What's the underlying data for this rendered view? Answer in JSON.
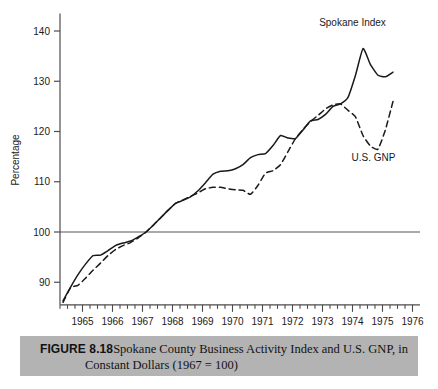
{
  "figure": {
    "label": "FIGURE 8.18",
    "caption_line_1": "Spokane County Business Activity Index and U.S. GNP, in",
    "caption_line_2": "Constant Dollars (1967 = 100)",
    "caption_bg_color": "#b3b3b3"
  },
  "chart_data": {
    "type": "line",
    "title": "",
    "subtitle": "",
    "xlabel": "",
    "ylabel": "Percentage",
    "xlim": [
      1964.25,
      1976.25
    ],
    "ylim": [
      85.5,
      143.5
    ],
    "yticks": [
      90,
      100,
      110,
      120,
      130,
      140
    ],
    "ytick_labels": [
      "90",
      "100",
      "110",
      "120",
      "130",
      "140"
    ],
    "xticks": [
      1965,
      1966,
      1967,
      1968,
      1969,
      1970,
      1971,
      1972,
      1973,
      1974,
      1975,
      1976
    ],
    "xtick_labels": [
      "1965",
      "1966",
      "1967",
      "1968",
      "1969",
      "1970",
      "1971",
      "1972",
      "1973",
      "1974",
      "1975",
      "1976"
    ],
    "minor_xtick_interval": 0.25,
    "grid": false,
    "reference_line": {
      "value": 100,
      "orientation": "horizontal",
      "color": "#8c8c8c"
    },
    "legend_position": "inline-annotations",
    "axis_color": "#4d4d4d",
    "series": [
      {
        "name": "Spokane Index",
        "style": "solid",
        "color": "#1a1a1a",
        "label_x": 1974.0,
        "label_y": 141.0,
        "x": [
          1964.35,
          1964.6,
          1964.85,
          1965.1,
          1965.35,
          1965.6,
          1965.85,
          1966.1,
          1966.35,
          1966.6,
          1966.85,
          1967.1,
          1967.35,
          1967.6,
          1967.85,
          1968.1,
          1968.35,
          1968.6,
          1968.85,
          1969.1,
          1969.35,
          1969.6,
          1969.85,
          1970.1,
          1970.35,
          1970.6,
          1970.85,
          1971.1,
          1971.35,
          1971.6,
          1971.85,
          1972.1,
          1972.35,
          1972.6,
          1972.85,
          1973.1,
          1973.35,
          1973.6,
          1973.85,
          1974.1,
          1974.35,
          1974.6,
          1974.85,
          1975.1,
          1975.35
        ],
        "y": [
          86.3,
          89.0,
          91.5,
          93.6,
          95.3,
          95.4,
          96.3,
          97.3,
          97.8,
          98.2,
          99.0,
          99.9,
          101.3,
          102.8,
          104.3,
          105.7,
          106.3,
          107.0,
          108.2,
          109.8,
          111.5,
          112.1,
          112.2,
          112.6,
          113.4,
          114.8,
          115.4,
          115.6,
          117.2,
          119.2,
          118.7,
          118.6,
          120.3,
          122.1,
          122.4,
          123.4,
          125.0,
          125.5,
          126.8,
          131.2,
          136.5,
          133.3,
          131.2,
          130.9,
          131.8
        ]
      },
      {
        "name": "U.S. GNP",
        "style": "dashed",
        "color": "#1a1a1a",
        "label_x": 1974.7,
        "label_y": 114.2,
        "x": [
          1964.35,
          1964.6,
          1964.85,
          1965.1,
          1965.35,
          1965.6,
          1965.85,
          1966.1,
          1966.35,
          1966.6,
          1966.85,
          1967.1,
          1967.35,
          1967.6,
          1967.85,
          1968.1,
          1968.35,
          1968.6,
          1968.85,
          1969.1,
          1969.35,
          1969.6,
          1969.85,
          1970.1,
          1970.35,
          1970.6,
          1970.85,
          1971.1,
          1971.35,
          1971.6,
          1971.85,
          1972.1,
          1972.35,
          1972.6,
          1972.85,
          1973.1,
          1973.35,
          1973.6,
          1973.85,
          1974.1,
          1974.35,
          1974.6,
          1974.85,
          1975.1,
          1975.35
        ],
        "y": [
          86.0,
          88.9,
          89.4,
          90.8,
          92.4,
          93.8,
          95.3,
          96.5,
          97.3,
          97.9,
          98.8,
          99.9,
          101.3,
          102.8,
          104.3,
          105.7,
          106.4,
          107.1,
          107.8,
          108.6,
          108.9,
          108.9,
          108.6,
          108.4,
          108.3,
          107.5,
          109.3,
          111.7,
          112.2,
          113.4,
          116.0,
          118.6,
          120.4,
          122.0,
          123.2,
          124.5,
          125.3,
          125.5,
          124.2,
          122.9,
          119.2,
          117.1,
          116.5,
          120.4,
          126.0
        ]
      }
    ]
  }
}
